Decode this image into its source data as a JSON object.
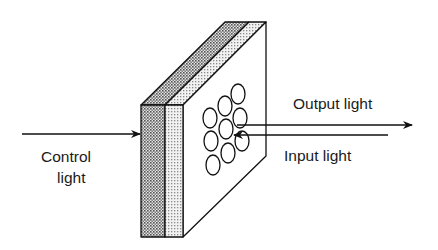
{
  "diagram": {
    "type": "optical-device-schematic",
    "labels": {
      "control_line1": "Control",
      "control_line2": "light",
      "output": "Output light",
      "input": "Input light"
    },
    "colors": {
      "stroke": "#111111",
      "dark_layer": "#9a9a9a",
      "light_layer": "#cfcfcf",
      "face": "#ffffff"
    },
    "components": [
      {
        "name": "dark-layer",
        "description": "Dark stippled front layer"
      },
      {
        "name": "light-layer",
        "description": "Light stippled middle layer"
      },
      {
        "name": "pixel-array",
        "description": "Hexagonal array of 10 circular elements on back face",
        "count": 10
      }
    ],
    "arrows": [
      {
        "name": "control-light",
        "direction": "right",
        "into": "front face"
      },
      {
        "name": "output-light",
        "direction": "right",
        "from": "pixel array"
      },
      {
        "name": "input-light",
        "direction": "left",
        "into": "pixel array"
      }
    ]
  }
}
